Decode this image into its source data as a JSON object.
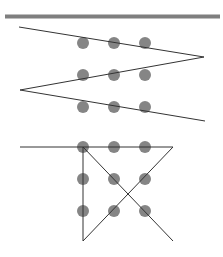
{
  "colors": {
    "background": "#ffffff",
    "top_bar": "#7f7f7f",
    "dot": "#858585",
    "line": "#333333"
  },
  "top_bar": {
    "x1": 5,
    "y": 16.5,
    "x2": 220,
    "thickness": 4
  },
  "dot_radius": 6,
  "puzzles": [
    {
      "name": "zigzag-solution",
      "dots": [
        [
          83,
          43
        ],
        [
          114,
          43
        ],
        [
          145,
          43
        ],
        [
          83,
          75
        ],
        [
          114,
          75
        ],
        [
          145,
          75
        ],
        [
          83,
          107
        ],
        [
          114,
          107
        ],
        [
          145,
          107
        ]
      ],
      "path": [
        [
          19,
          27
        ],
        [
          204,
          57
        ],
        [
          20,
          90
        ],
        [
          205,
          121
        ]
      ]
    },
    {
      "name": "four-line-solution",
      "dots": [
        [
          83,
          147
        ],
        [
          114,
          147
        ],
        [
          145,
          147
        ],
        [
          83,
          179
        ],
        [
          114,
          179
        ],
        [
          145,
          179
        ],
        [
          83,
          211
        ],
        [
          114,
          211
        ],
        [
          145,
          211
        ]
      ],
      "path": [
        [
          20,
          147
        ],
        [
          173,
          147
        ],
        [
          83,
          241
        ],
        [
          83,
          147
        ],
        [
          173,
          241
        ]
      ]
    }
  ]
}
